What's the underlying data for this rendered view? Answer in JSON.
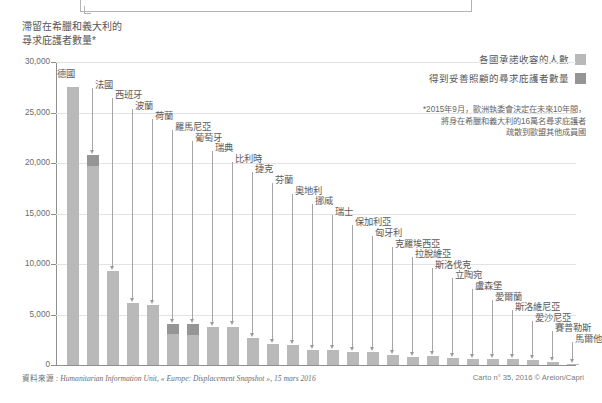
{
  "title": "滯留在希臘和義大利的\n尋求庇護者數量*",
  "title_line1": "滯留在希臘和義大利的",
  "title_line2": "尋求庇護者數量*",
  "legend": {
    "items": [
      {
        "label": "各國承諾收容的人數",
        "color": "#b9b9b9"
      },
      {
        "label": "得到妥善照顧的尋求庇護者數量",
        "color": "#959595"
      }
    ]
  },
  "footnote": {
    "line1": "*2015年9月，歐洲執委會決定在未來10年間，",
    "line2": "將身在希臘和義大利的16萬名尋求庇護者",
    "line3": "疏散到歐盟其他成員國"
  },
  "source": {
    "prefix": "資料來源 : ",
    "text": "Humanitarian Information Unit, « Europe: Displacement Snapshot », 15 mars 2016"
  },
  "credit": "Carto n° 35, 2016 © Areion/Capri",
  "chart_data": {
    "type": "bar",
    "xlabel": "",
    "ylabel": "",
    "ylim": [
      0,
      30000
    ],
    "ytick_labels": [
      "30,000",
      "25,000",
      "20,000",
      "15,000",
      "10,000",
      "5,000",
      "0"
    ],
    "ytick_values": [
      30000,
      25000,
      20000,
      15000,
      10000,
      5000,
      0
    ],
    "grid": true,
    "legend_position": "top-right",
    "stacked": true,
    "categories": [
      "德國",
      "法國",
      "西班牙",
      "波蘭",
      "荷蘭",
      "羅馬尼亞",
      "葡萄牙",
      "瑞典",
      "比利時",
      "捷克",
      "芬蘭",
      "奧地利",
      "挪威",
      "瑞士",
      "保加利亞",
      "匈牙利",
      "克羅埃西亞",
      "拉脫維亞",
      "斯洛伐克",
      "立陶宛",
      "盧森堡",
      "愛爾蘭",
      "斯洛維尼亞",
      "愛沙尼亞",
      "賽普勒斯",
      "馬爾他"
    ],
    "series": [
      {
        "name": "各國承諾收容的人數",
        "color": "#b9b9b9",
        "values": [
          27536,
          19714,
          9323,
          6182,
          5947,
          3100,
          2951,
          3766,
          3812,
          2691,
          2078,
          1953,
          1500,
          1500,
          1302,
          1294,
          968,
          776,
          902,
          671,
          557,
          600,
          567,
          519,
          320,
          131
        ]
      },
      {
        "name": "得到妥善照顧的尋求庇護者數量",
        "color": "#959595",
        "values": [
          0,
          1086,
          0,
          0,
          0,
          1000,
          1100,
          0,
          0,
          0,
          0,
          0,
          0,
          0,
          0,
          0,
          0,
          0,
          0,
          0,
          0,
          0,
          0,
          0,
          0,
          0
        ]
      }
    ],
    "totals": [
      27536,
      20800,
      9323,
      6182,
      5947,
      4100,
      4051,
      3766,
      3812,
      2691,
      2078,
      1953,
      1500,
      1500,
      1302,
      1294,
      968,
      776,
      902,
      671,
      557,
      600,
      567,
      519,
      320,
      131
    ]
  }
}
